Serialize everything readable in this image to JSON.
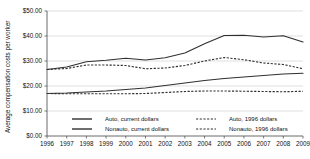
{
  "chart_data": {
    "type": "line",
    "title": "",
    "xlabel": "",
    "ylabel": "Average compensation costs per worker",
    "x": [
      1996,
      1997,
      1998,
      1999,
      2000,
      2001,
      2002,
      2003,
      2004,
      2005,
      2006,
      2007,
      2008,
      2009
    ],
    "categories": [
      "1996",
      "1997",
      "1998",
      "1999",
      "2000",
      "2001",
      "2002",
      "2003",
      "2004",
      "2005",
      "2006",
      "2007",
      "2008",
      "2009"
    ],
    "ylim": [
      0,
      50
    ],
    "ytick_values": [
      0,
      10,
      20,
      30,
      40,
      50
    ],
    "ytick_labels": [
      "$0.00",
      "$10.00",
      "$20.00",
      "$30.00",
      "$40.00",
      "$50.00"
    ],
    "grid": true,
    "legend_position": "bottom",
    "series": [
      {
        "name": "Auto, current dollars",
        "style": "solid",
        "color": "#303030",
        "values": [
          26.6,
          27.6,
          29.7,
          30.3,
          31.1,
          30.4,
          31.3,
          33.2,
          36.9,
          40.2,
          40.3,
          39.6,
          40.1,
          37.6
        ]
      },
      {
        "name": "Auto, 1996 dollars",
        "style": "dashed",
        "color": "#303030",
        "values": [
          26.6,
          27.0,
          28.4,
          28.4,
          28.2,
          26.9,
          27.2,
          28.2,
          30.0,
          31.4,
          30.5,
          29.2,
          28.6,
          26.9
        ]
      },
      {
        "name": "Nonauto, current dollars",
        "style": "solid",
        "color": "#303030",
        "values": [
          17.0,
          17.2,
          17.6,
          18.0,
          18.6,
          19.2,
          20.2,
          21.2,
          22.2,
          23.0,
          23.6,
          24.2,
          24.8,
          25.1
        ]
      },
      {
        "name": "Nonauto, 1996 dollars",
        "style": "dashed",
        "color": "#303030",
        "values": [
          17.0,
          16.9,
          16.9,
          16.9,
          16.9,
          17.0,
          17.4,
          17.8,
          18.0,
          18.0,
          17.9,
          17.8,
          17.7,
          17.9
        ]
      }
    ],
    "legend": [
      {
        "label": "Auto, current dollars",
        "style": "solid"
      },
      {
        "label": "Auto, 1996 dollars",
        "style": "dashed"
      },
      {
        "label": "Nonauto, current dollars",
        "style": "solid"
      },
      {
        "label": "Nonauto, 1996 dollars",
        "style": "dashed"
      }
    ]
  }
}
